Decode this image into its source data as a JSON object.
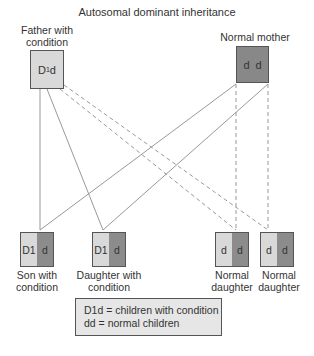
{
  "title": "Autosomal dominant inheritance",
  "parents": {
    "father": {
      "label_line1": "Father with",
      "label_line2": "condition",
      "genotype_main": "D",
      "genotype_sup": "1",
      "genotype_tail": "d",
      "color": "#d9d9d9"
    },
    "mother": {
      "label": "Normal mother",
      "allele1": "d",
      "allele2": "d",
      "color": "#888888"
    }
  },
  "children": [
    {
      "allele1": "D1",
      "allele2": "d",
      "label_line1": "Son with",
      "label_line2": "condition"
    },
    {
      "allele1": "D1",
      "allele2": "d",
      "label_line1": "Daughter with",
      "label_line2": "condition"
    },
    {
      "allele1": "d",
      "allele2": "d",
      "label_line1": "Normal",
      "label_line2": "daughter"
    },
    {
      "allele1": "d",
      "allele2": "d",
      "label_line1": "Normal",
      "label_line2": "daughter"
    }
  ],
  "legend": {
    "line1": "D1d = children with condition",
    "line2": "dd = normal children"
  },
  "colors": {
    "affected_allele": "#d9d9d9",
    "normal_allele": "#8c8c8c",
    "line": "#888888"
  }
}
